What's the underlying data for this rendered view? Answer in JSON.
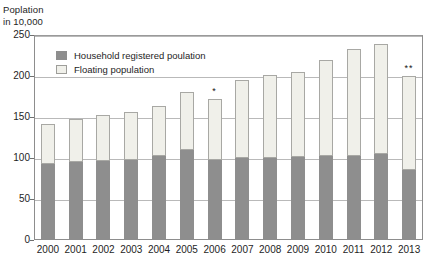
{
  "chart_data": {
    "type": "bar",
    "title": "Poplation in 10,000",
    "title_line1": "Poplation",
    "title_line2": "in 10,000",
    "xlabel": "",
    "ylabel": "Poplation in 10,000",
    "stacked": true,
    "grid": true,
    "legend_position": "inside-top-left",
    "ylim": [
      0,
      250
    ],
    "yticks": [
      0,
      50,
      100,
      150,
      200,
      250
    ],
    "ytick_labels": [
      "0",
      "50",
      "100",
      "150",
      "200",
      "250"
    ],
    "categories": [
      "2000",
      "2001",
      "2002",
      "2003",
      "2004",
      "2005",
      "2006",
      "2007",
      "2008",
      "2009",
      "2010",
      "2011",
      "2012",
      "2013"
    ],
    "series": [
      {
        "name": "Household registered poulation",
        "color": "#8e8e8e",
        "values": [
          93,
          95,
          96,
          98,
          102,
          110,
          97,
          100,
          100,
          101,
          102,
          102,
          105,
          85
        ]
      },
      {
        "name": "Floating population",
        "color": "#f0f0ea",
        "values": [
          48,
          52,
          56,
          58,
          61,
          71,
          75,
          95,
          101,
          104,
          118,
          131,
          134,
          115
        ]
      }
    ],
    "totals": [
      141,
      147,
      152,
      156,
      163,
      181,
      172,
      195,
      201,
      205,
      220,
      233,
      239,
      200
    ],
    "annotations": [
      {
        "category": "2006",
        "text": "*"
      },
      {
        "category": "2013",
        "text": "**"
      }
    ]
  },
  "legend": {
    "items": [
      {
        "label": "Household registered poulation",
        "swatch": "household-swatch"
      },
      {
        "label": "Floating population",
        "swatch": "floating-swatch"
      }
    ]
  }
}
